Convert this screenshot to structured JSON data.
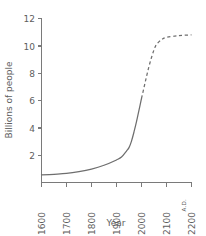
{
  "chart_data": {
    "type": "line",
    "title": "",
    "xlabel": "Year",
    "ylabel": "Billions of people",
    "xlim": [
      1600,
      2200
    ],
    "ylim": [
      0,
      12
    ],
    "grid": false,
    "legend": false,
    "x_tick_labels": [
      "1600",
      "1700",
      "1800",
      "1900",
      "2000",
      "2100",
      "2200"
    ],
    "x_ticks": [
      1600,
      1700,
      1800,
      1900,
      2000,
      2100,
      2200
    ],
    "y_tick_labels": [
      "2",
      "4",
      "6",
      "8",
      "10",
      "12"
    ],
    "y_ticks": [
      2,
      4,
      6,
      8,
      10,
      12
    ],
    "era_annotation": "A.D.",
    "line_color": "#6e6e6e",
    "axis_color": "#7a7a7a",
    "series": [
      {
        "name": "World population (historical)",
        "style": "solid",
        "x": [
          1600,
          1650,
          1700,
          1750,
          1800,
          1850,
          1900,
          1920,
          1940,
          1950,
          1960,
          1970,
          1980,
          1990,
          2000
        ],
        "values": [
          0.55,
          0.6,
          0.66,
          0.79,
          0.98,
          1.26,
          1.65,
          1.86,
          2.3,
          2.55,
          3.03,
          3.7,
          4.45,
          5.3,
          6.15
        ]
      },
      {
        "name": "World population (projected)",
        "style": "dashed",
        "x": [
          2000,
          2010,
          2020,
          2030,
          2040,
          2050,
          2060,
          2080,
          2100,
          2150,
          2200
        ],
        "values": [
          6.15,
          6.95,
          7.75,
          8.5,
          9.15,
          9.7,
          10.1,
          10.45,
          10.62,
          10.75,
          10.8
        ]
      }
    ]
  },
  "axes": {
    "y_title": "Billions of people",
    "x_title": "Year"
  },
  "labels": {
    "y": [
      "12",
      "10",
      "8",
      "6",
      "4",
      "2"
    ],
    "x": [
      "1600",
      "1700",
      "1800",
      "1900",
      "2000",
      "2100",
      "2200"
    ],
    "era": "A.D."
  }
}
